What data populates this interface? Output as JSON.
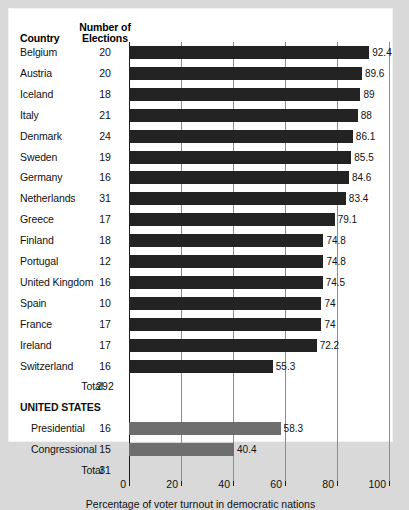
{
  "table_headers": {
    "country": "Country",
    "elections_line1": "Number of",
    "elections_line2": "Elections"
  },
  "axis": {
    "xlabel": "Percentage of voter turnout in democratic nations",
    "ticks": [
      "0",
      "20",
      "40",
      "60",
      "80",
      "100"
    ]
  },
  "section_headers": {
    "united_states": "UNITED STATES"
  },
  "totals": {
    "countries_label": "Total",
    "countries_value": "292",
    "us_label": "Total",
    "us_value": "31"
  },
  "colors": {
    "country_bar": "#232323",
    "us_bar": "#6e6e6e",
    "page_background": "#d9d9d9",
    "card_background": "#ffffff",
    "gridline": "#8c8c8c"
  },
  "chart_data": {
    "type": "bar",
    "orientation": "horizontal",
    "title": "",
    "xlabel": "Percentage of voter turnout in democratic nations",
    "ylabel": "",
    "xlim": [
      0,
      100
    ],
    "xticks": [
      0,
      20,
      40,
      60,
      80,
      100
    ],
    "grid": true,
    "legend": "none",
    "categories": [
      "Belgium",
      "Austria",
      "Iceland",
      "Italy",
      "Denmark",
      "Sweden",
      "Germany",
      "Netherlands",
      "Greece",
      "Finland",
      "Portugal",
      "United Kingdom",
      "Spain",
      "France",
      "Ireland",
      "Switzerland",
      "Presidential",
      "Congressional"
    ],
    "values": [
      92.4,
      89.6,
      89,
      88,
      86.1,
      85.5,
      84.6,
      83.4,
      79.1,
      74.8,
      74.8,
      74.5,
      74,
      74,
      72.2,
      55.3,
      58.3,
      40.4
    ],
    "number_of_elections": [
      20,
      20,
      18,
      21,
      24,
      19,
      16,
      31,
      17,
      18,
      12,
      16,
      10,
      17,
      17,
      16,
      16,
      15
    ],
    "rows": [
      {
        "country": "Belgium",
        "elections": "20",
        "value": "92.4",
        "num": 92.4,
        "group": "country"
      },
      {
        "country": "Austria",
        "elections": "20",
        "value": "89.6",
        "num": 89.6,
        "group": "country"
      },
      {
        "country": "Iceland",
        "elections": "18",
        "value": "89",
        "num": 89,
        "group": "country"
      },
      {
        "country": "Italy",
        "elections": "21",
        "value": "88",
        "num": 88,
        "group": "country"
      },
      {
        "country": "Denmark",
        "elections": "24",
        "value": "86.1",
        "num": 86.1,
        "group": "country"
      },
      {
        "country": "Sweden",
        "elections": "19",
        "value": "85.5",
        "num": 85.5,
        "group": "country"
      },
      {
        "country": "Germany",
        "elections": "16",
        "value": "84.6",
        "num": 84.6,
        "group": "country"
      },
      {
        "country": "Netherlands",
        "elections": "31",
        "value": "83.4",
        "num": 83.4,
        "group": "country"
      },
      {
        "country": "Greece",
        "elections": "17",
        "value": "79.1",
        "num": 79.1,
        "group": "country"
      },
      {
        "country": "Finland",
        "elections": "18",
        "value": "74.8",
        "num": 74.8,
        "group": "country"
      },
      {
        "country": "Portugal",
        "elections": "12",
        "value": "74.8",
        "num": 74.8,
        "group": "country"
      },
      {
        "country": "United Kingdom",
        "elections": "16",
        "value": "74.5",
        "num": 74.5,
        "group": "country"
      },
      {
        "country": "Spain",
        "elections": "10",
        "value": "74",
        "num": 74,
        "group": "country"
      },
      {
        "country": "France",
        "elections": "17",
        "value": "74",
        "num": 74,
        "group": "country"
      },
      {
        "country": "Ireland",
        "elections": "17",
        "value": "72.2",
        "num": 72.2,
        "group": "country"
      },
      {
        "country": "Switzerland",
        "elections": "16",
        "value": "55.3",
        "num": 55.3,
        "group": "country"
      },
      {
        "country": "Total",
        "elections": "292",
        "value": "",
        "num": null,
        "group": "total"
      },
      {
        "country": "UNITED STATES",
        "elections": "",
        "value": "",
        "num": null,
        "group": "section"
      },
      {
        "country": "Presidential",
        "elections": "16",
        "value": "58.3",
        "num": 58.3,
        "group": "us"
      },
      {
        "country": "Congressional",
        "elections": "15",
        "value": "40.4",
        "num": 40.4,
        "group": "us"
      },
      {
        "country": "Total",
        "elections": "31",
        "value": "",
        "num": null,
        "group": "total"
      }
    ]
  }
}
